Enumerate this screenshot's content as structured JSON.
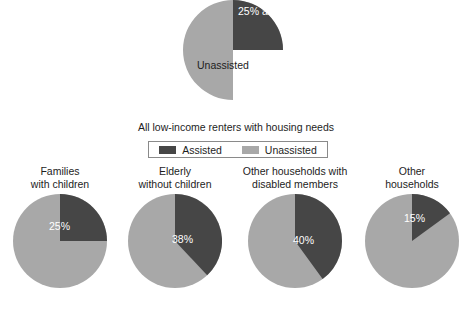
{
  "chart_data": [
    {
      "type": "pie",
      "name": "main-overall-pie",
      "title": "All low-income renters with housing needs",
      "categories": [
        "Assisted",
        "Unassisted"
      ],
      "values": [
        25,
        75
      ],
      "value_unit": "percent",
      "slice_labels": [
        "25%\nassisted",
        "Unassisted"
      ],
      "colors": [
        "#464646",
        "#a8a8a8"
      ],
      "start_angle_deg": 0,
      "direction": "clockwise",
      "legend_position": "below-title"
    },
    {
      "type": "pie",
      "name": "families-with-children-pie",
      "title": "Families\nwith children",
      "categories": [
        "Assisted",
        "Unassisted"
      ],
      "values": [
        25,
        75
      ],
      "value_unit": "percent",
      "slice_labels": [
        "25%",
        ""
      ],
      "colors": [
        "#464646",
        "#a8a8a8"
      ],
      "start_angle_deg": 0,
      "direction": "clockwise"
    },
    {
      "type": "pie",
      "name": "elderly-without-children-pie",
      "title": "Elderly\nwithout children",
      "categories": [
        "Assisted",
        "Unassisted"
      ],
      "values": [
        38,
        62
      ],
      "value_unit": "percent",
      "slice_labels": [
        "38%",
        ""
      ],
      "colors": [
        "#464646",
        "#a8a8a8"
      ],
      "start_angle_deg": 0,
      "direction": "clockwise"
    },
    {
      "type": "pie",
      "name": "other-households-disabled-pie",
      "title": "Other households with\ndisabled members",
      "categories": [
        "Assisted",
        "Unassisted"
      ],
      "values": [
        40,
        60
      ],
      "value_unit": "percent",
      "slice_labels": [
        "40%",
        ""
      ],
      "colors": [
        "#464646",
        "#a8a8a8"
      ],
      "start_angle_deg": 0,
      "direction": "clockwise"
    },
    {
      "type": "pie",
      "name": "other-households-pie",
      "title": "Other\nhouseholds",
      "categories": [
        "Assisted",
        "Unassisted"
      ],
      "values": [
        15,
        85
      ],
      "value_unit": "percent",
      "slice_labels": [
        "15%",
        ""
      ],
      "colors": [
        "#464646",
        "#a8a8a8"
      ],
      "start_angle_deg": 0,
      "direction": "clockwise"
    }
  ],
  "main_pie": {
    "assisted_label": "25%\nassisted",
    "unassisted_label": "Unassisted",
    "assisted_value": 25,
    "unassisted_value": 75
  },
  "caption": {
    "text": "All low-income renters with housing needs"
  },
  "legend": {
    "entries": [
      {
        "label": "Assisted",
        "color": "#464646"
      },
      {
        "label": "Unassisted",
        "color": "#a8a8a8"
      }
    ]
  },
  "small_charts": [
    {
      "title": "Families\nwith children",
      "pct_label": "25%",
      "assisted": 25,
      "unassisted": 75
    },
    {
      "title": "Elderly\nwithout children",
      "pct_label": "38%",
      "assisted": 38,
      "unassisted": 62
    },
    {
      "title": "Other households with\ndisabled members",
      "pct_label": "40%",
      "assisted": 40,
      "unassisted": 60
    },
    {
      "title": "Other\nhouseholds",
      "pct_label": "15%",
      "assisted": 15,
      "unassisted": 85
    }
  ],
  "colors": {
    "assisted": "#464646",
    "unassisted": "#a8a8a8",
    "background": "#ffffff",
    "text": "#1d1d1d",
    "legend_border": "#8a8a8a"
  }
}
